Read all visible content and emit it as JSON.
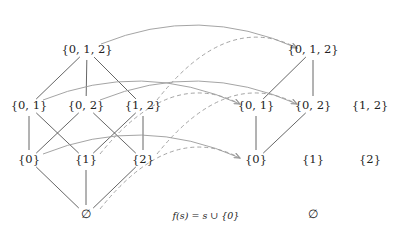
{
  "diagram": {
    "caption": "f(s) = s ∪ {0}",
    "colors": {
      "text": "#222222",
      "hasse_edge": "#555555",
      "arrow": "#9a9a9a"
    },
    "left_lattice": {
      "nodes": [
        {
          "id": "L012",
          "label": "{0, 1, 2}",
          "x": 87,
          "y": 50
        },
        {
          "id": "L01",
          "label": "{0, 1}",
          "x": 29,
          "y": 106
        },
        {
          "id": "L02",
          "label": "{0, 2}",
          "x": 86,
          "y": 106
        },
        {
          "id": "L12",
          "label": "{1, 2}",
          "x": 143,
          "y": 106
        },
        {
          "id": "L0",
          "label": "{0}",
          "x": 29,
          "y": 160
        },
        {
          "id": "L1",
          "label": "{1}",
          "x": 86,
          "y": 160
        },
        {
          "id": "L2",
          "label": "{2}",
          "x": 143,
          "y": 160
        },
        {
          "id": "Lempty",
          "label": "∅",
          "x": 86,
          "y": 215
        }
      ],
      "edges": [
        [
          "L012",
          "L01"
        ],
        [
          "L012",
          "L02"
        ],
        [
          "L012",
          "L12"
        ],
        [
          "L01",
          "L0"
        ],
        [
          "L01",
          "L1"
        ],
        [
          "L02",
          "L0"
        ],
        [
          "L02",
          "L2"
        ],
        [
          "L12",
          "L1"
        ],
        [
          "L12",
          "L2"
        ],
        [
          "L0",
          "Lempty"
        ],
        [
          "L1",
          "Lempty"
        ],
        [
          "L2",
          "Lempty"
        ]
      ]
    },
    "right_lattice": {
      "nodes": [
        {
          "id": "R012",
          "label": "{0, 1, 2}",
          "x": 313,
          "y": 50
        },
        {
          "id": "R01",
          "label": "{0, 1}",
          "x": 256,
          "y": 106
        },
        {
          "id": "R02",
          "label": "{0, 2}",
          "x": 313,
          "y": 106
        },
        {
          "id": "R12",
          "label": "{1, 2}",
          "x": 370,
          "y": 106
        },
        {
          "id": "R0",
          "label": "{0}",
          "x": 256,
          "y": 160
        },
        {
          "id": "R1",
          "label": "{1}",
          "x": 313,
          "y": 160
        },
        {
          "id": "R2",
          "label": "{2}",
          "x": 370,
          "y": 160
        },
        {
          "id": "Rempty",
          "label": "∅",
          "x": 313,
          "y": 215
        }
      ],
      "edges": [
        [
          "R012",
          "R01"
        ],
        [
          "R012",
          "R02"
        ],
        [
          "R01",
          "R0"
        ],
        [
          "R02",
          "R0"
        ]
      ]
    },
    "mapping_arrows": [
      {
        "from": "L012",
        "to": "R012",
        "style": "solid"
      },
      {
        "from": "L01",
        "to": "R01",
        "style": "solid"
      },
      {
        "from": "L02",
        "to": "R02",
        "style": "solid"
      },
      {
        "from": "L0",
        "to": "R0",
        "style": "solid"
      },
      {
        "from": "L12",
        "to": "R012",
        "style": "dashed"
      },
      {
        "from": "L1",
        "to": "R01",
        "style": "dashed"
      },
      {
        "from": "L2",
        "to": "R02",
        "style": "dashed"
      },
      {
        "from": "Lempty",
        "to": "R0",
        "style": "dashed"
      }
    ]
  }
}
